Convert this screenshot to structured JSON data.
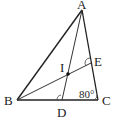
{
  "diagram": {
    "type": "triangle-geometry",
    "points": {
      "A": {
        "label": "A",
        "x": 82,
        "y": 10
      },
      "B": {
        "label": "B",
        "x": 17,
        "y": 100
      },
      "C": {
        "label": "C",
        "x": 98,
        "y": 100
      },
      "D": {
        "label": "D",
        "x": 62,
        "y": 100
      },
      "E": {
        "label": "E",
        "x": 91,
        "y": 63
      },
      "I": {
        "label": "I",
        "x": 68,
        "y": 74
      }
    },
    "segments": [
      "AB",
      "BC",
      "CA",
      "AD",
      "BE"
    ],
    "angle_marks": [
      {
        "vertex": "C",
        "text": "80°"
      },
      {
        "vertex": "D",
        "mark": "arc"
      },
      {
        "vertex": "E",
        "mark": "arc"
      }
    ],
    "labels": {
      "A": "A",
      "B": "B",
      "C": "C",
      "D": "D",
      "E": "E",
      "I": "I",
      "angle_C": "80°"
    }
  }
}
